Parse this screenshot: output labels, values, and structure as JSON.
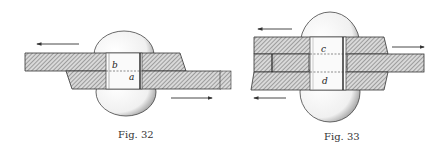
{
  "figures": [
    {
      "id": "fig32",
      "caption": "Fig. 32",
      "description": "Lap joint with single rivet in single shear",
      "labels": {
        "upper": "b",
        "lower": "a"
      },
      "arrows": [
        "left (upper plate)",
        "right (lower plate)"
      ]
    },
    {
      "id": "fig33",
      "caption": "Fig. 33",
      "description": "Butt joint with double cover plates, rivet in double shear",
      "labels": {
        "upper": "c",
        "lower": "d"
      },
      "arrows": [
        "left (upper cover)",
        "right (middle plate)",
        "left (lower cover)"
      ]
    }
  ],
  "colors": {
    "ink": "#333333",
    "hatch": "#555555",
    "paper": "#ffffff",
    "rivet_fill": "#f4f4f4"
  }
}
